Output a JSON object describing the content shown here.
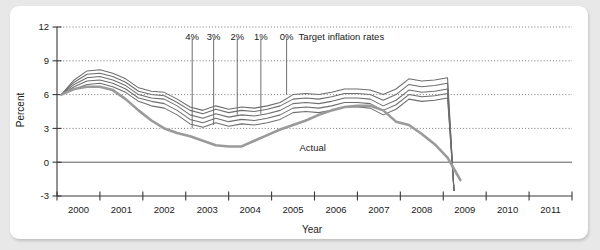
{
  "chart_data": {
    "type": "line",
    "title": "",
    "xlabel": "Year",
    "ylabel": "Percent",
    "xlim": [
      1999.5,
      2011.5
    ],
    "ylim": [
      -3,
      12
    ],
    "yticks": [
      12,
      9,
      6,
      3,
      0,
      -3
    ],
    "ytick_labels": [
      "12",
      "9",
      "6",
      "3",
      "0",
      "-3"
    ],
    "xticks": [
      2000,
      2001,
      2002,
      2003,
      2004,
      2005,
      2006,
      2007,
      2008,
      2009,
      2010,
      2011
    ],
    "xtick_labels": [
      "2000",
      "2001",
      "2002",
      "2003",
      "2004",
      "2005",
      "2006",
      "2007",
      "2008",
      "2009",
      "2010",
      "2011"
    ],
    "grid": "horizontal-dotted",
    "legend_position": "inline-annotations",
    "annotation_title": "Target inflation rates",
    "x": [
      1999.6,
      1999.9,
      2000.2,
      2000.5,
      2000.8,
      2001.1,
      2001.4,
      2001.7,
      2002.0,
      2002.3,
      2002.6,
      2002.9,
      2003.2,
      2003.5,
      2003.8,
      2004.1,
      2004.4,
      2004.7,
      2005.0,
      2005.3,
      2005.6,
      2005.9,
      2006.2,
      2006.5,
      2006.8,
      2007.1,
      2007.4,
      2007.7,
      2008.0,
      2008.3,
      2008.6,
      2008.75
    ],
    "series": [
      {
        "name": "4%",
        "label": "4%",
        "values": [
          6.0,
          7.3,
          8.1,
          8.2,
          7.9,
          7.4,
          6.6,
          6.3,
          6.2,
          5.6,
          4.9,
          4.6,
          5.0,
          4.7,
          4.9,
          4.8,
          5.0,
          5.3,
          6.0,
          6.1,
          6.0,
          6.2,
          6.5,
          6.5,
          6.4,
          6.0,
          6.5,
          7.4,
          7.2,
          7.3,
          7.5,
          -2.5
        ]
      },
      {
        "name": "3%",
        "label": "3%",
        "values": [
          6.0,
          7.1,
          7.8,
          7.9,
          7.6,
          7.1,
          6.3,
          6.0,
          5.9,
          5.3,
          4.6,
          4.3,
          4.7,
          4.4,
          4.6,
          4.5,
          4.7,
          5.0,
          5.6,
          5.7,
          5.6,
          5.8,
          6.1,
          6.1,
          6.0,
          5.5,
          6.0,
          6.9,
          6.7,
          6.8,
          7.0,
          -2.5
        ]
      },
      {
        "name": "2%",
        "label": "2%",
        "values": [
          6.0,
          6.9,
          7.5,
          7.6,
          7.3,
          6.8,
          6.0,
          5.7,
          5.6,
          5.0,
          4.2,
          3.9,
          4.3,
          4.0,
          4.2,
          4.1,
          4.3,
          4.6,
          5.2,
          5.3,
          5.2,
          5.4,
          5.7,
          5.7,
          5.6,
          5.0,
          5.5,
          6.4,
          6.2,
          6.3,
          6.5,
          -2.5
        ]
      },
      {
        "name": "1%",
        "label": "1%",
        "values": [
          6.0,
          6.7,
          7.2,
          7.3,
          7.0,
          6.5,
          5.7,
          5.4,
          5.2,
          4.6,
          3.8,
          3.5,
          3.9,
          3.6,
          3.8,
          3.7,
          3.9,
          4.2,
          4.8,
          4.9,
          4.8,
          5.0,
          5.3,
          5.3,
          5.2,
          4.6,
          5.1,
          6.0,
          5.8,
          5.9,
          6.1,
          -2.5
        ]
      },
      {
        "name": "0%",
        "label": "0%",
        "values": [
          6.0,
          6.5,
          6.9,
          7.0,
          6.7,
          6.2,
          5.4,
          5.0,
          4.8,
          4.2,
          3.4,
          3.1,
          3.5,
          3.2,
          3.4,
          3.3,
          3.5,
          3.8,
          4.4,
          4.5,
          4.4,
          4.6,
          4.9,
          4.9,
          4.8,
          4.2,
          4.7,
          5.6,
          5.4,
          5.5,
          5.7,
          -2.5
        ]
      }
    ],
    "actual_series": {
      "name": "Actual",
      "label": "Actual",
      "x": [
        1999.6,
        1999.9,
        2000.2,
        2000.5,
        2000.8,
        2001.1,
        2001.4,
        2001.7,
        2002.0,
        2002.3,
        2002.6,
        2002.9,
        2003.2,
        2003.5,
        2003.8,
        2004.1,
        2004.4,
        2004.7,
        2005.0,
        2005.3,
        2005.6,
        2005.9,
        2006.2,
        2006.5,
        2006.8,
        2007.1,
        2007.4,
        2007.7,
        2008.0,
        2008.3,
        2008.6,
        2008.9
      ],
      "values": [
        6.0,
        6.5,
        6.7,
        6.7,
        6.4,
        5.6,
        4.6,
        3.7,
        3.0,
        2.6,
        2.3,
        1.9,
        1.5,
        1.4,
        1.4,
        1.9,
        2.4,
        2.9,
        3.3,
        3.7,
        4.2,
        4.6,
        4.9,
        5.0,
        5.0,
        4.6,
        3.6,
        3.3,
        2.5,
        1.6,
        0.4,
        -1.6
      ]
    },
    "target_lines": [
      {
        "label": "4%",
        "x": 2002.65,
        "y_top": 11.0,
        "y_bottom": 3.0
      },
      {
        "label": "3%",
        "x": 2003.15,
        "y_top": 11.0,
        "y_bottom": 3.3
      },
      {
        "label": "2%",
        "x": 2003.7,
        "y_top": 11.0,
        "y_bottom": 4.2
      },
      {
        "label": "1%",
        "x": 2004.25,
        "y_top": 11.0,
        "y_bottom": 4.3
      },
      {
        "label": "0%",
        "x": 2004.85,
        "y_top": 11.0,
        "y_bottom": 6.0
      }
    ],
    "colors": {
      "series_line": "#6e6e6e",
      "actual_line": "#9a9a9a",
      "axis": "#3a3a3a",
      "grid": "#555555",
      "card": "#ffffff",
      "page": "#e8e8e8"
    }
  }
}
